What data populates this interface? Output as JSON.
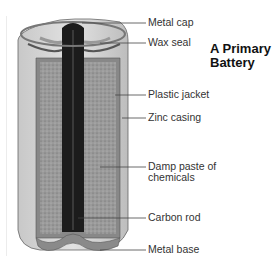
{
  "title": {
    "line1": "A Primary",
    "line2": "Battery"
  },
  "labels": [
    {
      "id": "metal-cap",
      "text": "Metal cap"
    },
    {
      "id": "wax-seal",
      "text": "Wax seal"
    },
    {
      "id": "plastic-jacket",
      "text": "Plastic jacket"
    },
    {
      "id": "zinc-casing",
      "text": "Zinc casing"
    },
    {
      "id": "damp-paste",
      "line1": "Damp paste of",
      "line2": "chemicals"
    },
    {
      "id": "carbon-rod",
      "text": "Carbon rod"
    },
    {
      "id": "metal-base",
      "text": "Metal base"
    }
  ]
}
